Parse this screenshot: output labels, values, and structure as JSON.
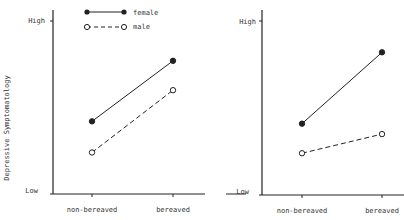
{
  "chart_data": [
    {
      "type": "line",
      "panel": "left",
      "title": "",
      "xlabel": "",
      "ylabel": "Depressive Symptomatology",
      "categories": [
        "non-bereaved",
        "bereaved"
      ],
      "yticks": [
        "Low",
        "High"
      ],
      "ylim": [
        0,
        1
      ],
      "series": [
        {
          "name": "female",
          "style": "solid-filled",
          "values": [
            0.42,
            0.77
          ]
        },
        {
          "name": "male",
          "style": "dashed-open",
          "values": [
            0.24,
            0.6
          ]
        }
      ],
      "legend": {
        "placement": "top",
        "entries": [
          "female",
          "male"
        ]
      }
    },
    {
      "type": "line",
      "panel": "right",
      "title": "",
      "xlabel": "",
      "ylabel": "",
      "categories": [
        "non-bereaved",
        "bereaved"
      ],
      "yticks": [
        "Low",
        "High"
      ],
      "ylim": [
        0,
        1
      ],
      "series": [
        {
          "name": "female",
          "style": "solid-filled",
          "values": [
            0.41,
            0.82
          ]
        },
        {
          "name": "male",
          "style": "dashed-open",
          "values": [
            0.24,
            0.35
          ]
        }
      ]
    }
  ],
  "colors": {
    "ink": "#222222",
    "background": "#ffffff"
  }
}
